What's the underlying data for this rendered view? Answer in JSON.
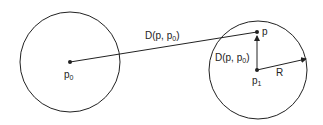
{
  "diagram": {
    "points": {
      "p0": {
        "name": "p",
        "sub": "0"
      },
      "p": {
        "name": "p"
      },
      "p1": {
        "name": "p",
        "sub": "1"
      }
    },
    "labels": {
      "distance_main": {
        "prefix": "D(p, p",
        "sub": "0",
        "suffix": ")"
      },
      "distance_local": {
        "prefix": "D(p, p",
        "sub": "0",
        "suffix": ")"
      },
      "radius": "R"
    },
    "colors": {
      "stroke": "#222222",
      "background": "#ffffff"
    }
  }
}
